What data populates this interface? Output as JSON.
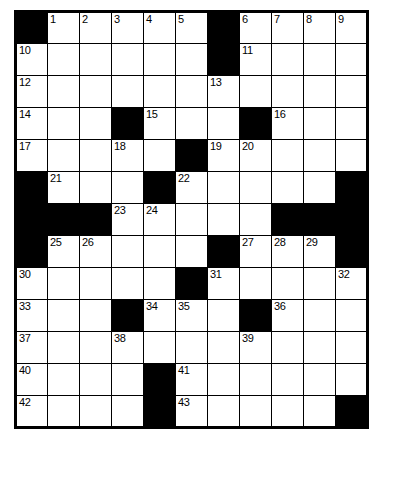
{
  "puzzle": {
    "title": "Crossword Grid",
    "rows": 13,
    "cols": 11,
    "block_color": "#000000",
    "cell_color": "#ffffff",
    "border_color": "#000000",
    "highest_clue_number": 43,
    "grid": [
      [
        {
          "type": "block"
        },
        {
          "type": "cell",
          "number": "1"
        },
        {
          "type": "cell",
          "number": "2"
        },
        {
          "type": "cell",
          "number": "3"
        },
        {
          "type": "cell",
          "number": "4"
        },
        {
          "type": "cell",
          "number": "5"
        },
        {
          "type": "block"
        },
        {
          "type": "cell",
          "number": "6"
        },
        {
          "type": "cell",
          "number": "7"
        },
        {
          "type": "cell",
          "number": "8"
        },
        {
          "type": "cell",
          "number": "9"
        }
      ],
      [
        {
          "type": "cell",
          "number": "10"
        },
        {
          "type": "cell",
          "number": ""
        },
        {
          "type": "cell",
          "number": ""
        },
        {
          "type": "cell",
          "number": ""
        },
        {
          "type": "cell",
          "number": ""
        },
        {
          "type": "cell",
          "number": ""
        },
        {
          "type": "block"
        },
        {
          "type": "cell",
          "number": "11"
        },
        {
          "type": "cell",
          "number": ""
        },
        {
          "type": "cell",
          "number": ""
        },
        {
          "type": "cell",
          "number": ""
        }
      ],
      [
        {
          "type": "cell",
          "number": "12"
        },
        {
          "type": "cell",
          "number": ""
        },
        {
          "type": "cell",
          "number": ""
        },
        {
          "type": "cell",
          "number": ""
        },
        {
          "type": "cell",
          "number": ""
        },
        {
          "type": "cell",
          "number": ""
        },
        {
          "type": "cell",
          "number": "13"
        },
        {
          "type": "cell",
          "number": ""
        },
        {
          "type": "cell",
          "number": ""
        },
        {
          "type": "cell",
          "number": ""
        },
        {
          "type": "cell",
          "number": ""
        }
      ],
      [
        {
          "type": "cell",
          "number": "14"
        },
        {
          "type": "cell",
          "number": ""
        },
        {
          "type": "cell",
          "number": ""
        },
        {
          "type": "block"
        },
        {
          "type": "cell",
          "number": "15"
        },
        {
          "type": "cell",
          "number": ""
        },
        {
          "type": "cell",
          "number": ""
        },
        {
          "type": "block"
        },
        {
          "type": "cell",
          "number": "16"
        },
        {
          "type": "cell",
          "number": ""
        },
        {
          "type": "cell",
          "number": ""
        }
      ],
      [
        {
          "type": "cell",
          "number": "17"
        },
        {
          "type": "cell",
          "number": ""
        },
        {
          "type": "cell",
          "number": ""
        },
        {
          "type": "cell",
          "number": "18"
        },
        {
          "type": "cell",
          "number": ""
        },
        {
          "type": "block"
        },
        {
          "type": "cell",
          "number": "19"
        },
        {
          "type": "cell",
          "number": "20"
        },
        {
          "type": "cell",
          "number": ""
        },
        {
          "type": "cell",
          "number": ""
        },
        {
          "type": "cell",
          "number": ""
        }
      ],
      [
        {
          "type": "block"
        },
        {
          "type": "cell",
          "number": "21"
        },
        {
          "type": "cell",
          "number": ""
        },
        {
          "type": "cell",
          "number": ""
        },
        {
          "type": "block"
        },
        {
          "type": "cell",
          "number": "22"
        },
        {
          "type": "cell",
          "number": ""
        },
        {
          "type": "cell",
          "number": ""
        },
        {
          "type": "cell",
          "number": ""
        },
        {
          "type": "cell",
          "number": ""
        },
        {
          "type": "block"
        }
      ],
      [
        {
          "type": "block"
        },
        {
          "type": "block"
        },
        {
          "type": "block"
        },
        {
          "type": "cell",
          "number": "23"
        },
        {
          "type": "cell",
          "number": "24"
        },
        {
          "type": "cell",
          "number": ""
        },
        {
          "type": "cell",
          "number": ""
        },
        {
          "type": "cell",
          "number": ""
        },
        {
          "type": "block"
        },
        {
          "type": "block"
        },
        {
          "type": "block"
        }
      ],
      [
        {
          "type": "block"
        },
        {
          "type": "cell",
          "number": "25"
        },
        {
          "type": "cell",
          "number": "26"
        },
        {
          "type": "cell",
          "number": ""
        },
        {
          "type": "cell",
          "number": ""
        },
        {
          "type": "cell",
          "number": ""
        },
        {
          "type": "block"
        },
        {
          "type": "cell",
          "number": "27"
        },
        {
          "type": "cell",
          "number": "28"
        },
        {
          "type": "cell",
          "number": "29"
        },
        {
          "type": "block"
        }
      ],
      [
        {
          "type": "cell",
          "number": "30"
        },
        {
          "type": "cell",
          "number": ""
        },
        {
          "type": "cell",
          "number": ""
        },
        {
          "type": "cell",
          "number": ""
        },
        {
          "type": "cell",
          "number": ""
        },
        {
          "type": "block"
        },
        {
          "type": "cell",
          "number": "31"
        },
        {
          "type": "cell",
          "number": ""
        },
        {
          "type": "cell",
          "number": ""
        },
        {
          "type": "cell",
          "number": ""
        },
        {
          "type": "cell",
          "number": "32"
        }
      ],
      [
        {
          "type": "cell",
          "number": "33"
        },
        {
          "type": "cell",
          "number": ""
        },
        {
          "type": "cell",
          "number": ""
        },
        {
          "type": "block"
        },
        {
          "type": "cell",
          "number": "34"
        },
        {
          "type": "cell",
          "number": "35"
        },
        {
          "type": "cell",
          "number": ""
        },
        {
          "type": "block"
        },
        {
          "type": "cell",
          "number": "36"
        },
        {
          "type": "cell",
          "number": ""
        },
        {
          "type": "cell",
          "number": ""
        }
      ],
      [
        {
          "type": "cell",
          "number": "37"
        },
        {
          "type": "cell",
          "number": ""
        },
        {
          "type": "cell",
          "number": ""
        },
        {
          "type": "cell",
          "number": "38"
        },
        {
          "type": "cell",
          "number": ""
        },
        {
          "type": "cell",
          "number": ""
        },
        {
          "type": "cell",
          "number": ""
        },
        {
          "type": "cell",
          "number": "39"
        },
        {
          "type": "cell",
          "number": ""
        },
        {
          "type": "cell",
          "number": ""
        },
        {
          "type": "cell",
          "number": ""
        }
      ],
      [
        {
          "type": "cell",
          "number": "40"
        },
        {
          "type": "cell",
          "number": ""
        },
        {
          "type": "cell",
          "number": ""
        },
        {
          "type": "cell",
          "number": ""
        },
        {
          "type": "block"
        },
        {
          "type": "cell",
          "number": "41"
        },
        {
          "type": "cell",
          "number": ""
        },
        {
          "type": "cell",
          "number": ""
        },
        {
          "type": "cell",
          "number": ""
        },
        {
          "type": "cell",
          "number": ""
        },
        {
          "type": "cell",
          "number": ""
        }
      ],
      [
        {
          "type": "cell",
          "number": "42"
        },
        {
          "type": "cell",
          "number": ""
        },
        {
          "type": "cell",
          "number": ""
        },
        {
          "type": "cell",
          "number": ""
        },
        {
          "type": "block"
        },
        {
          "type": "cell",
          "number": "43"
        },
        {
          "type": "cell",
          "number": ""
        },
        {
          "type": "cell",
          "number": ""
        },
        {
          "type": "cell",
          "number": ""
        },
        {
          "type": "cell",
          "number": ""
        },
        {
          "type": "block"
        }
      ]
    ]
  }
}
